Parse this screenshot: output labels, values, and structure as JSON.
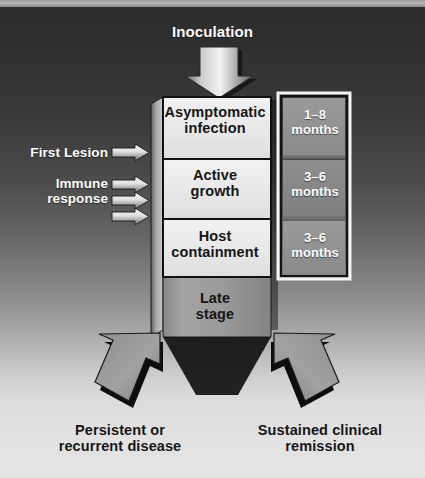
{
  "figure": {
    "type": "flowchart",
    "title_text": "Inoculation",
    "orientation": "vertical-trunk-with-bifurcation",
    "palette": {
      "background_top": "#2e2e2e",
      "background_bottom": "#e4e4e4",
      "trunk_fill": "#9c9c9c",
      "trunk_shadow": "#0d0d0d",
      "box_fill": "#e9e9e9",
      "box_border": "#141414",
      "months_panel": "#8a8a8a",
      "months_panel_border": "#111111",
      "months_outer_frame": "#f2f2f2",
      "text_light": "#ffffff",
      "text_dark": "#161616"
    }
  },
  "top": {
    "label": "Inoculation",
    "arrow_icon": "down-arrow-icon"
  },
  "stages": [
    {
      "id": "stage-asymptomatic",
      "label": "Asymptomatic\ninfection",
      "duration": "1–8\nmonths"
    },
    {
      "id": "stage-active-growth",
      "label": "Active\ngrowth",
      "duration": "3–6\nmonths"
    },
    {
      "id": "stage-host-containment",
      "label": "Host\ncontainment",
      "duration": "3–6\nmonths"
    },
    {
      "id": "stage-late",
      "label": "Late\nstage",
      "duration": ""
    }
  ],
  "durations": {
    "asymptomatic": "1–8\nmonths",
    "active_growth": "3–6\nmonths",
    "host_containment": "3–6\nmonths"
  },
  "annotations": {
    "first_lesion": {
      "label": "First Lesion",
      "arrow_count": 1,
      "arrow_icon": "right-arrow-icon"
    },
    "immune_response": {
      "label": "Immune\nresponse",
      "arrow_count": 3,
      "arrow_icon": "right-arrow-icon"
    }
  },
  "outcomes": [
    {
      "id": "outcome-left",
      "label": "Persistent or\nrecurrent disease",
      "arrow_icon": "down-left-arrow-icon"
    },
    {
      "id": "outcome-right",
      "label": "Sustained clinical\nremission",
      "arrow_icon": "down-right-arrow-icon"
    }
  ]
}
